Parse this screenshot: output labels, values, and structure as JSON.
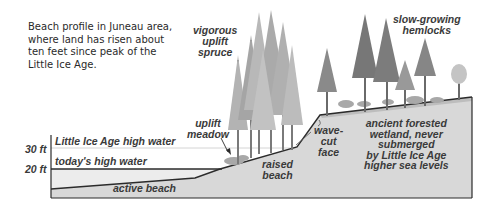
{
  "caption": {
    "lines": [
      "Beach profile in Juneau area,",
      "where land has risen about",
      "ten feet since peak of the",
      "Little Ice Age."
    ]
  },
  "labels": {
    "vigorous_spruce": [
      "vigorous",
      "uplift",
      "spruce"
    ],
    "slow_hemlocks": [
      "slow-growing",
      "hemlocks"
    ],
    "uplift_meadow": [
      "uplift",
      "meadow"
    ],
    "little_ice_age_high_water": "Little Ice Age high water",
    "todays_high_water": "today's high water",
    "active_beach": "active beach",
    "raised_beach": [
      "raised",
      "beach"
    ],
    "wave_cut_face": [
      "wave-",
      "cut",
      "face"
    ],
    "ancient_wetland": [
      "ancient forested",
      "wetland, never",
      "submerged",
      "by Little Ice Age",
      "higher sea levels"
    ]
  },
  "axis": {
    "tick_30": "30 ft",
    "tick_20": "20 ft"
  },
  "colors": {
    "ground_fill": "#d6d6d6",
    "beach_fill": "#e4e4e4",
    "outline": "#2b2b2b",
    "tree_dark": "#6e6e6e",
    "tree_mid": "#8f8f8f",
    "tree_light": "#b5b5b5",
    "label_text": "#3a3a3a"
  }
}
